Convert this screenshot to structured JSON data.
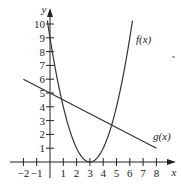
{
  "chart_data": {
    "type": "line",
    "title": "",
    "xlabel": "x",
    "ylabel": "y",
    "xlim": [
      -2.5,
      9
    ],
    "ylim": [
      -0.5,
      11
    ],
    "grid": false,
    "x_ticks": [
      -2,
      -1,
      1,
      2,
      3,
      4,
      5,
      6,
      7,
      8
    ],
    "y_ticks": [
      1,
      2,
      3,
      4,
      5,
      6,
      7,
      8,
      9,
      10
    ],
    "series": [
      {
        "name": "f(x)",
        "label": "f(x)",
        "formula": "(x-3)^2",
        "x": [
          -0.2,
          0,
          0.5,
          1,
          1.5,
          2,
          2.5,
          3,
          3.5,
          4,
          4.5,
          5,
          5.5,
          6,
          6.2
        ],
        "values": [
          10.24,
          9,
          6.25,
          4,
          2.25,
          1,
          0.25,
          0,
          0.25,
          1,
          2.25,
          4,
          6.25,
          9,
          10.24
        ]
      },
      {
        "name": "g(x)",
        "label": "g(x)",
        "formula": "5 - 0.5x",
        "x": [
          -2,
          8
        ],
        "values": [
          6,
          1
        ]
      }
    ],
    "annotations": [
      {
        "text": "f(x)",
        "x": 6.3,
        "y": 9.0
      },
      {
        "text": "g(x)",
        "x": 7.2,
        "y": 2.1
      }
    ]
  },
  "axis_labels": {
    "x": "x",
    "y": "y"
  },
  "tick_labels": {
    "x": [
      "−2",
      "−1",
      "1",
      "2",
      "3",
      "4",
      "5",
      "6",
      "7",
      "8"
    ],
    "y": [
      "1",
      "2",
      "3",
      "4",
      "5",
      "6",
      "7",
      "8",
      "9",
      "10"
    ]
  },
  "curve_labels": {
    "f": "f(x)",
    "g": "g(x)"
  },
  "colors": {
    "axis": "#222222",
    "curve": "#333333",
    "background": "#ffffff"
  }
}
